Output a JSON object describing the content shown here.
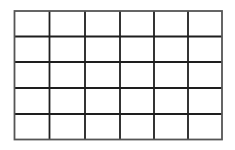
{
  "grid": {
    "columns": 6,
    "rows": 5,
    "x_lines": [
      14.5,
      49.5,
      85,
      120,
      154,
      188,
      222
    ],
    "y_lines": [
      11,
      36.5,
      62,
      88,
      114,
      139.5
    ],
    "line_color": "#1e1e1e",
    "border_color": "#555555",
    "line_width": 1.8,
    "background": "#ffffff"
  }
}
